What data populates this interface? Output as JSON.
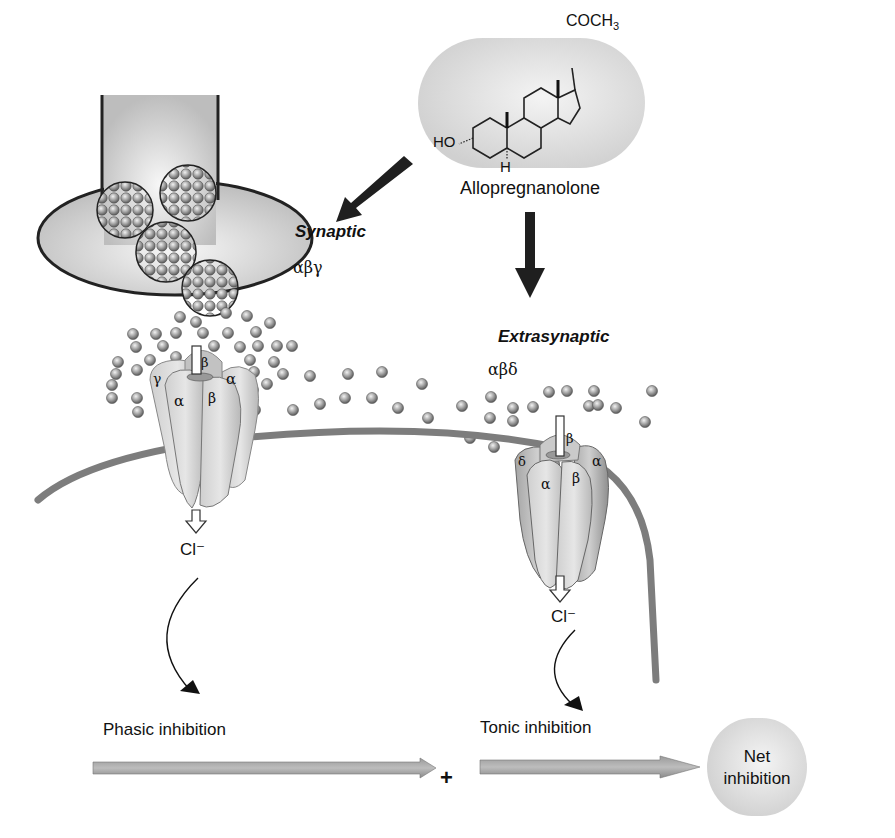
{
  "molecule": {
    "name": "Allopregnanolone",
    "group_top": "COCH",
    "group_top_sub": "3",
    "group_hydroxyl": "HO",
    "group_h": "H"
  },
  "pathways": {
    "synaptic": {
      "title": "Synaptic",
      "subunits": "αβγ"
    },
    "extrasynaptic": {
      "title": "Extrasynaptic",
      "subunits": "αβδ"
    }
  },
  "receptor_synaptic": {
    "subunits": [
      "γ",
      "β",
      "α",
      "α",
      "β"
    ]
  },
  "receptor_extrasynaptic": {
    "subunits": [
      "δ",
      "β",
      "α",
      "α",
      "β"
    ]
  },
  "ions": {
    "left": "Cl⁻",
    "right": "Cl⁻"
  },
  "outcomes": {
    "phasic": "Phasic inhibition",
    "tonic": "Tonic inhibition",
    "plus": "+",
    "net_line1": "Net",
    "net_line2": "inhibition"
  },
  "colors": {
    "membrane": "#7d7d7d",
    "gray_fill": "#cfcfcf",
    "arrow_dark": "#1f1f1f"
  }
}
